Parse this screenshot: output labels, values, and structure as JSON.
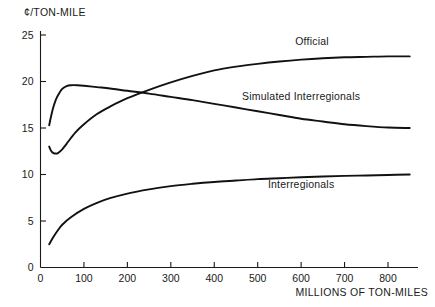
{
  "chart_data": {
    "type": "line",
    "title": "",
    "xlabel": "MILLIONS OF TON-MILES",
    "ylabel": "¢/TON-MILE",
    "xlim": [
      0,
      860
    ],
    "ylim": [
      0,
      26
    ],
    "grid": false,
    "legend_position": "inline-annotations",
    "xticks": [
      0,
      100,
      200,
      300,
      400,
      500,
      600,
      700,
      800
    ],
    "xtick_labels": [
      "0",
      "100",
      "200",
      "300",
      "400",
      "500",
      "600",
      "700",
      "800"
    ],
    "yticks": [
      0,
      5,
      10,
      15,
      20,
      25
    ],
    "ytick_labels": [
      "0",
      "5",
      "10",
      "15",
      "20",
      "25"
    ],
    "series": [
      {
        "name": "Official",
        "label": "Official",
        "label_x": 625,
        "label_y": 23.9,
        "x": [
          20,
          25,
          30,
          35,
          40,
          50,
          60,
          80,
          100,
          130,
          160,
          200,
          250,
          300,
          350,
          400,
          450,
          500,
          550,
          600,
          650,
          700,
          750,
          800,
          850
        ],
        "y": [
          13.0,
          12.5,
          12.3,
          12.25,
          12.3,
          12.7,
          13.3,
          14.5,
          15.4,
          16.5,
          17.3,
          18.2,
          19.1,
          19.9,
          20.6,
          21.2,
          21.6,
          21.9,
          22.15,
          22.35,
          22.5,
          22.6,
          22.65,
          22.7,
          22.7
        ]
      },
      {
        "name": "Simulated Interregionals",
        "label": "Simulated Interregionals",
        "label_x": 600,
        "label_y": 18.0,
        "x": [
          20,
          25,
          30,
          35,
          40,
          50,
          60,
          70,
          85,
          100,
          130,
          160,
          200,
          250,
          300,
          350,
          400,
          450,
          500,
          550,
          600,
          650,
          700,
          750,
          800,
          850
        ],
        "y": [
          15.3,
          16.4,
          17.3,
          18.0,
          18.5,
          19.2,
          19.5,
          19.6,
          19.6,
          19.55,
          19.4,
          19.25,
          19.0,
          18.7,
          18.35,
          18.0,
          17.6,
          17.2,
          16.8,
          16.4,
          16.0,
          15.7,
          15.4,
          15.2,
          15.05,
          15.0
        ]
      },
      {
        "name": "Interregionals",
        "label": "Interregionals",
        "label_x": 600,
        "label_y": 8.6,
        "x": [
          20,
          30,
          40,
          50,
          70,
          100,
          130,
          160,
          200,
          250,
          300,
          350,
          400,
          450,
          500,
          550,
          600,
          650,
          700,
          750,
          800,
          850
        ],
        "y": [
          2.5,
          3.3,
          4.0,
          4.6,
          5.4,
          6.3,
          6.95,
          7.45,
          7.95,
          8.4,
          8.75,
          9.0,
          9.2,
          9.35,
          9.5,
          9.6,
          9.7,
          9.78,
          9.85,
          9.9,
          9.95,
          10.0
        ]
      }
    ]
  },
  "colors": {
    "line": "#111111",
    "axis": "#1a1a1a",
    "background": "#ffffff"
  }
}
